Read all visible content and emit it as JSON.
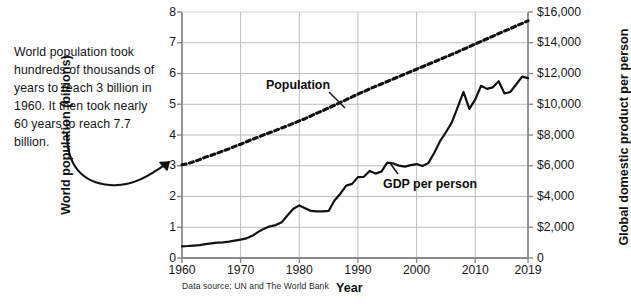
{
  "annotation": {
    "text": "World population took hundreds of thousands of years to reach 3 billion in 1960. It then took nearly 60 years to reach 7.7 billion."
  },
  "source_note": "Data source: UN and The World Bank",
  "labels": {
    "population": "Population",
    "gdp": "GDP per person"
  },
  "chart_data": {
    "type": "line",
    "title": "",
    "xlabel": "Year",
    "ylabel": "World population (billions)",
    "y2label": "Global domestic product per person",
    "xlim": [
      1960,
      2019
    ],
    "ylim": [
      0,
      8
    ],
    "y2lim": [
      0,
      16000
    ],
    "grid": true,
    "legend_position": "inline-annotations",
    "xticks": [
      1960,
      1970,
      1980,
      1990,
      2000,
      2010,
      2019
    ],
    "xticklabels": [
      "1960",
      "1970",
      "1980",
      "1990",
      "2000",
      "2010",
      "2019"
    ],
    "yticks": [
      0,
      1,
      2,
      3,
      4,
      5,
      6,
      7,
      8
    ],
    "yticklabels": [
      "0",
      "1",
      "2",
      "3",
      "4",
      "5",
      "6",
      "7",
      "8"
    ],
    "y2ticks": [
      0,
      2000,
      4000,
      6000,
      8000,
      10000,
      12000,
      14000,
      16000
    ],
    "y2ticklabels": [
      "0",
      "$2,000",
      "$4,000",
      "$6,000",
      "$8,000",
      "$10,000",
      "$12,000",
      "$14,000",
      "$16,000"
    ],
    "gridlines_x": [
      1970,
      1980,
      1990,
      2000,
      2010
    ],
    "gridlines_y": [
      1,
      2,
      3,
      4,
      5,
      6,
      7
    ],
    "x": [
      1960,
      1961,
      1962,
      1963,
      1964,
      1965,
      1966,
      1967,
      1968,
      1969,
      1970,
      1971,
      1972,
      1973,
      1974,
      1975,
      1976,
      1977,
      1978,
      1979,
      1980,
      1981,
      1982,
      1983,
      1984,
      1985,
      1986,
      1987,
      1988,
      1989,
      1990,
      1991,
      1992,
      1993,
      1994,
      1995,
      1996,
      1997,
      1998,
      1999,
      2000,
      2001,
      2002,
      2003,
      2004,
      2005,
      2006,
      2007,
      2008,
      2009,
      2010,
      2011,
      2012,
      2013,
      2014,
      2015,
      2016,
      2017,
      2018,
      2019
    ],
    "series": [
      {
        "name": "Population",
        "unit": "billions",
        "axis": "left",
        "style": "dotted",
        "color": "#111111",
        "values": [
          3.03,
          3.07,
          3.13,
          3.2,
          3.28,
          3.34,
          3.41,
          3.48,
          3.55,
          3.63,
          3.7,
          3.78,
          3.86,
          3.93,
          4.01,
          4.08,
          4.15,
          4.23,
          4.3,
          4.38,
          4.46,
          4.53,
          4.62,
          4.71,
          4.79,
          4.88,
          4.97,
          5.06,
          5.15,
          5.24,
          5.33,
          5.41,
          5.5,
          5.58,
          5.66,
          5.74,
          5.82,
          5.9,
          5.98,
          6.06,
          6.14,
          6.22,
          6.3,
          6.38,
          6.46,
          6.54,
          6.62,
          6.7,
          6.79,
          6.87,
          6.96,
          7.04,
          7.13,
          7.21,
          7.3,
          7.38,
          7.46,
          7.55,
          7.63,
          7.71
        ]
      },
      {
        "name": "GDP per person",
        "unit": "USD",
        "axis": "right",
        "style": "solid",
        "color": "#111111",
        "values": [
          760,
          780,
          810,
          840,
          900,
          950,
          1000,
          1020,
          1060,
          1130,
          1200,
          1280,
          1440,
          1700,
          1900,
          2060,
          2140,
          2320,
          2780,
          3200,
          3420,
          3230,
          3060,
          3030,
          3030,
          3060,
          3740,
          4180,
          4710,
          4820,
          5260,
          5280,
          5660,
          5490,
          5620,
          6200,
          6150,
          6010,
          5940,
          6040,
          6110,
          5980,
          6170,
          6830,
          7600,
          8180,
          8800,
          9800,
          10800,
          9700,
          10300,
          11200,
          11000,
          11100,
          11500,
          10700,
          10800,
          11300,
          11800,
          11700
        ]
      }
    ]
  }
}
